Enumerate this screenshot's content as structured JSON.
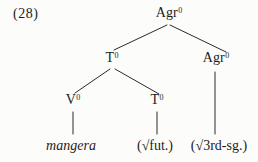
{
  "figure": {
    "example_number": "(28)",
    "colors": {
      "ink": "#1c1c1c",
      "paper": "#fcfcfa"
    },
    "tree": {
      "nodes": [
        {
          "id": "agr-top",
          "base": "Agr",
          "sup": "0"
        },
        {
          "id": "t-mid",
          "base": "T",
          "sup": "0"
        },
        {
          "id": "agr-right",
          "base": "Agr",
          "sup": "0"
        },
        {
          "id": "v-low",
          "base": "V",
          "sup": "0"
        },
        {
          "id": "t-low",
          "base": "T",
          "sup": "0"
        }
      ],
      "leaves": [
        {
          "id": "mangera",
          "text": "mangera"
        },
        {
          "id": "fut",
          "text": "(√fut.)"
        },
        {
          "id": "third-sg",
          "text": "(√3rd-sg.)"
        }
      ]
    }
  }
}
